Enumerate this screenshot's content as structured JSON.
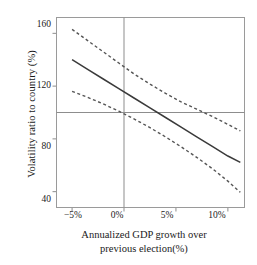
{
  "chart_data": {
    "type": "line",
    "title": "",
    "xlabel": "Annualized GDP growth over previous election(%)",
    "ylabel": "Volatility ratio to country (%)",
    "xlabel_line1": "Annualized GDP growth over",
    "xlabel_line2": "previous election(%)",
    "xlim": [
      -6.5,
      11.6
    ],
    "ylim": [
      28,
      172
    ],
    "xticks": [
      -5,
      0,
      5,
      10
    ],
    "xticklabels": [
      "−5%",
      "0%",
      "5%",
      "10%"
    ],
    "yticks": [
      40,
      80,
      120,
      160
    ],
    "yticklabels": [
      "40",
      "80",
      "120",
      "160"
    ],
    "grid": false,
    "legend": "none",
    "reference_lines": [
      {
        "name": "horizontal-reference-line",
        "orientation": "horizontal",
        "value": 100
      },
      {
        "name": "vertical-reference-line",
        "orientation": "vertical",
        "value": 0
      }
    ],
    "x": [
      -5.0,
      -3.5,
      -2.0,
      -0.5,
      1.0,
      2.5,
      4.0,
      5.5,
      7.0,
      8.5,
      10.0,
      11.2
    ],
    "series": [
      {
        "name": "Upper 95% confidence band",
        "style": "dashed",
        "color": "#555555",
        "values": [
          163.0,
          154.5,
          146.0,
          137.5,
          129.0,
          121.5,
          114.5,
          108.0,
          102.5,
          97.0,
          91.0,
          86.0
        ]
      },
      {
        "name": "Fitted volatility ratio",
        "style": "solid",
        "color": "#3a3a3a",
        "values": [
          140.0,
          132.7,
          125.4,
          118.1,
          110.8,
          103.5,
          96.2,
          88.9,
          81.6,
          74.3,
          67.0,
          62.2
        ]
      },
      {
        "name": "Lower 95% confidence band",
        "style": "dashed",
        "color": "#555555",
        "values": [
          116.0,
          111.5,
          106.5,
          101.0,
          95.0,
          88.5,
          81.5,
          74.0,
          66.0,
          57.5,
          48.0,
          39.5
        ]
      }
    ]
  },
  "axis_frame_color": "#9a9a9a",
  "reference_line_color": "#8d8d8d",
  "tick_color": "#8d8d8d"
}
